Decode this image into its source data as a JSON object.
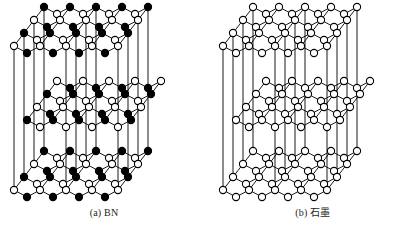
{
  "figure": {
    "background_color": "#ffffff",
    "line_color": "#000000",
    "panels": [
      {
        "id": "a",
        "caption": "(a) BN",
        "structure": "hexagonal boron nitride layered crystal",
        "atom_types": [
          {
            "name": "boron",
            "marker": "open-circle",
            "fill": "#ffffff",
            "stroke": "#000000"
          },
          {
            "name": "nitrogen",
            "marker": "filled-circle",
            "fill": "#000000",
            "stroke": "#000000"
          }
        ],
        "layers": 3,
        "stacking": "AA (atoms eclipsed between layers)"
      },
      {
        "id": "b",
        "caption": "(b) 石墨",
        "structure": "graphite layered crystal",
        "atom_types": [
          {
            "name": "carbon",
            "marker": "open-circle",
            "fill": "#ffffff",
            "stroke": "#000000"
          }
        ],
        "layers": 3,
        "stacking": "AB (middle layer offset)"
      }
    ]
  },
  "geometry": {
    "rows_per_layer": 4,
    "cells_per_row": 4,
    "layer_tops": [
      14,
      88,
      158
    ],
    "row_dx": -10,
    "row_dy": 13,
    "cell_w": 26,
    "zig": 7,
    "origin_x": 44,
    "node_radius": 3.6,
    "middle_shift_x": 13
  }
}
